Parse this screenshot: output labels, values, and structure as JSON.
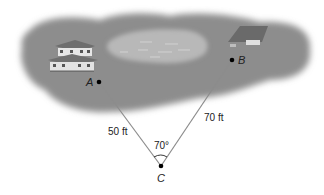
{
  "diagram": {
    "points": {
      "A": {
        "label": "A",
        "x": 99,
        "y": 82
      },
      "B": {
        "label": "B",
        "x": 232,
        "y": 60
      },
      "C": {
        "label": "C",
        "x": 161,
        "y": 166
      }
    },
    "segments": [
      {
        "from": "A",
        "to": "C",
        "label": "50 ft"
      },
      {
        "from": "B",
        "to": "C",
        "label": "70 ft"
      }
    ],
    "angle": {
      "vertex": "C",
      "label": "70°"
    },
    "scene": {
      "background": "gray landscape blob with pond",
      "objects": [
        "house near A",
        "house near B",
        "pond between"
      ]
    },
    "colors": {
      "land": "#8a8a8a",
      "pond": "#b5b5b5",
      "line": "#8c8c8c",
      "point": "#000000",
      "text": "#222222"
    }
  }
}
